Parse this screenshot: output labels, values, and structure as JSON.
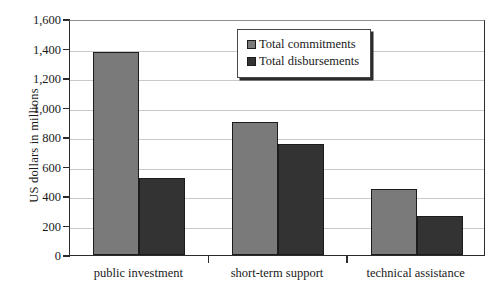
{
  "chart_data": {
    "type": "bar",
    "title": "",
    "xlabel": "",
    "ylabel": "US dollars in millions",
    "categories": [
      "public investment",
      "short-term support",
      "technical assistance"
    ],
    "series": [
      {
        "name": "Total commitments",
        "color": "#7a7a7a",
        "values": [
          1375,
          900,
          450
        ]
      },
      {
        "name": "Total disbursements",
        "color": "#333333",
        "values": [
          525,
          750,
          265
        ]
      }
    ],
    "ylim": [
      0,
      1600
    ],
    "ytick_values": [
      0,
      200,
      400,
      600,
      800,
      1000,
      1200,
      1400,
      1600
    ],
    "ytick_labels": [
      "0",
      "200",
      "400",
      "600",
      "800",
      "1,000",
      "1,200",
      "1,400",
      "1,600"
    ],
    "grid": true,
    "legend_position": "top-center"
  }
}
